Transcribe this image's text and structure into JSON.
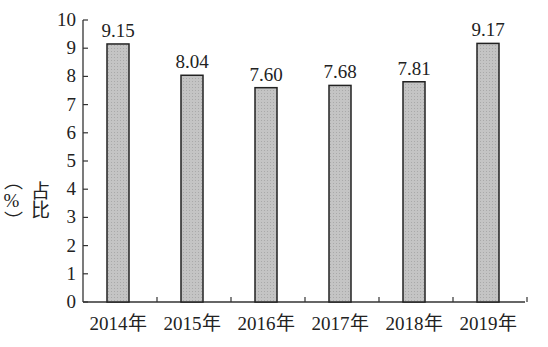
{
  "chart_data": {
    "type": "bar",
    "title": "",
    "xlabel": "",
    "ylabel": "占比（%）",
    "categories": [
      "2014年",
      "2015年",
      "2016年",
      "2017年",
      "2018年",
      "2019年"
    ],
    "values": [
      9.15,
      8.04,
      7.6,
      7.68,
      7.81,
      9.17
    ],
    "data_labels": [
      "9.15",
      "8.04",
      "7.60",
      "7.68",
      "7.81",
      "9.17"
    ],
    "ylim": [
      0,
      10
    ],
    "yticks": [
      0,
      1,
      2,
      3,
      4,
      5,
      6,
      7,
      8,
      9,
      10
    ],
    "grid": false,
    "legend": null,
    "bar_fill": "#bdbdbd",
    "bar_edge": "#222222"
  }
}
